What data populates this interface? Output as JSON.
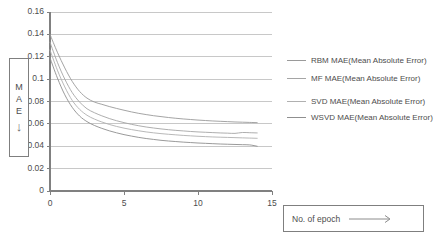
{
  "chart_data": {
    "type": "line",
    "title": "",
    "xlabel": "No. of epoch",
    "ylabel": "MAE",
    "xlim": [
      0,
      15
    ],
    "ylim": [
      0,
      0.16
    ],
    "grid": true,
    "legend_position": "right",
    "x_ticks": [
      "0",
      "5",
      "10",
      "15"
    ],
    "x_tick_values": [
      0,
      5,
      10,
      15
    ],
    "y_ticks": [
      "0",
      "0.02",
      "0.04",
      "0.06",
      "0.08",
      "0.1",
      "0.12",
      "0.14",
      "0.16"
    ],
    "y_tick_values": [
      0,
      0.02,
      0.04,
      0.06,
      0.08,
      0.1,
      0.12,
      0.14,
      0.16
    ],
    "x": [
      0,
      0.5,
      1,
      1.5,
      2,
      2.5,
      3,
      3.5,
      4,
      4.5,
      5,
      5.5,
      6,
      6.5,
      7,
      7.5,
      8,
      8.5,
      9,
      9.5,
      10,
      10.5,
      11,
      11.5,
      12,
      12.5,
      13,
      13.5,
      14
    ],
    "series": [
      {
        "name": "RBM MAE(Mean Absolute Error)",
        "color": "#9a9a9a",
        "values": [
          0.14,
          0.124,
          0.11,
          0.098,
          0.089,
          0.083,
          0.0795,
          0.0775,
          0.0755,
          0.0738,
          0.0722,
          0.0707,
          0.0694,
          0.0683,
          0.0673,
          0.0665,
          0.0657,
          0.065,
          0.0644,
          0.0639,
          0.0634,
          0.063,
          0.0626,
          0.0623,
          0.062,
          0.0617,
          0.0615,
          0.0613,
          0.0611
        ]
      },
      {
        "name": "MF MAE(Mean Absolute Error)",
        "color": "#a5a5a5",
        "values": [
          0.133,
          0.115,
          0.1,
          0.088,
          0.0795,
          0.0735,
          0.07,
          0.0672,
          0.0648,
          0.0628,
          0.0611,
          0.0596,
          0.0583,
          0.0572,
          0.0563,
          0.0555,
          0.0548,
          0.0542,
          0.0537,
          0.0532,
          0.0528,
          0.0525,
          0.0522,
          0.0519,
          0.0517,
          0.0515,
          0.0523,
          0.0521,
          0.0519
        ]
      },
      {
        "name": "SVD MAE(Mean Absolute Error)",
        "color": "#b0b0b0",
        "values": [
          0.126,
          0.108,
          0.093,
          0.081,
          0.073,
          0.0677,
          0.0643,
          0.0617,
          0.0595,
          0.0577,
          0.0562,
          0.0549,
          0.0538,
          0.0528,
          0.052,
          0.0513,
          0.0507,
          0.0502,
          0.0497,
          0.0493,
          0.0489,
          0.0486,
          0.0483,
          0.0481,
          0.0479,
          0.0477,
          0.0475,
          0.0473,
          0.0471
        ]
      },
      {
        "name": "WSVD MAE(Mean Absolute Error)",
        "color": "#8f8f8f",
        "values": [
          0.119,
          0.101,
          0.086,
          0.0748,
          0.067,
          0.062,
          0.0586,
          0.056,
          0.0538,
          0.052,
          0.0504,
          0.0491,
          0.0479,
          0.0469,
          0.0461,
          0.0453,
          0.0447,
          0.0442,
          0.0437,
          0.0433,
          0.0429,
          0.0426,
          0.0423,
          0.042,
          0.0418,
          0.0416,
          0.0414,
          0.0412,
          0.04
        ]
      }
    ]
  },
  "axis_captions": {
    "y_letters": [
      "M",
      "A",
      "E"
    ],
    "y_arrow": "↓",
    "x_text": "No. of epoch",
    "x_arrow": "→"
  },
  "colors": {
    "axis": "#808080",
    "grid": "#c8c8c8",
    "text": "#4d4d4d",
    "box_border": "#7f7f7f",
    "background": "#ffffff"
  }
}
